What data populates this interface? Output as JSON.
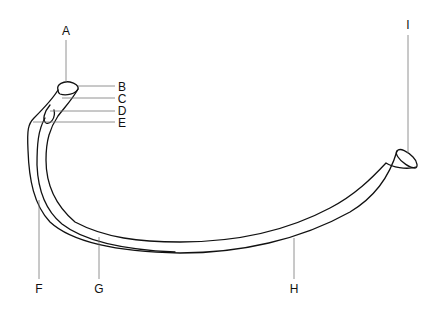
{
  "figure": {
    "colors": {
      "stroke": "#111111",
      "leader": "#777777",
      "background": "#ffffff"
    },
    "labels": [
      {
        "id": "A",
        "text": "A",
        "x": 66,
        "y": 31
      },
      {
        "id": "B",
        "text": "B",
        "x": 122,
        "y": 87
      },
      {
        "id": "C",
        "text": "C",
        "x": 122,
        "y": 99
      },
      {
        "id": "D",
        "text": "D",
        "x": 122,
        "y": 111
      },
      {
        "id": "E",
        "text": "E",
        "x": 122,
        "y": 123
      },
      {
        "id": "F",
        "text": "F",
        "x": 39,
        "y": 289
      },
      {
        "id": "G",
        "text": "G",
        "x": 99,
        "y": 289
      },
      {
        "id": "H",
        "text": "H",
        "x": 294,
        "y": 289
      },
      {
        "id": "I",
        "text": "I",
        "x": 408,
        "y": 25
      }
    ]
  }
}
